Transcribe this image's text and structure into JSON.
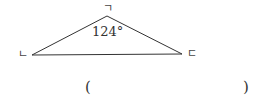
{
  "diagram": {
    "type": "triangle",
    "vertices": {
      "top": {
        "label": "ㄱ",
        "x": 107,
        "y": 16
      },
      "left": {
        "label": "ㄴ",
        "x": 32,
        "y": 55
      },
      "right": {
        "label": "ㄷ",
        "x": 182,
        "y": 54
      }
    },
    "angle_label": "124°",
    "stroke_color": "#333333"
  },
  "answer_blank": {
    "open": "(",
    "close": ")"
  }
}
